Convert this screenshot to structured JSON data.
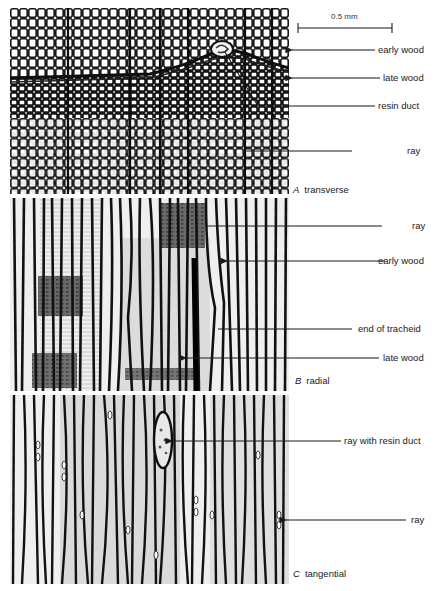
{
  "figure": {
    "scale_bar": {
      "label": "0.5 mm"
    },
    "panels": [
      {
        "id": "A",
        "letter": "A",
        "name": "transverse",
        "labels": [
          {
            "text": "early wood",
            "arrow": true
          },
          {
            "text": "late wood",
            "arrow": true
          },
          {
            "text": "resin duct",
            "arrow": false
          },
          {
            "text": "ray",
            "arrow": false
          }
        ]
      },
      {
        "id": "B",
        "letter": "B",
        "name": "radial",
        "labels": [
          {
            "text": "ray",
            "arrow": false
          },
          {
            "text": "early wood",
            "arrow": true
          },
          {
            "text": "end of tracheid",
            "arrow": false
          },
          {
            "text": "late wood",
            "arrow": true
          }
        ]
      },
      {
        "id": "C",
        "letter": "C",
        "name": "tangential",
        "labels": [
          {
            "text": "ray with resin duct",
            "arrow": true
          },
          {
            "text": "ray",
            "arrow": true
          }
        ]
      }
    ]
  },
  "colors": {
    "ink": "#1a1a1a",
    "cell_wall": "#161616",
    "background": "#ffffff",
    "grey_tissue": "#bdbdbd"
  }
}
